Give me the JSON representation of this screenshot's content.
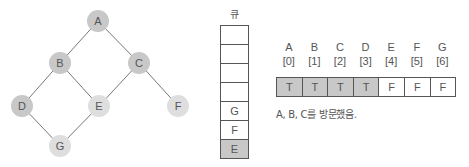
{
  "graph": {
    "nodes": [
      {
        "id": "A",
        "x": 98,
        "y": 21,
        "visited": true
      },
      {
        "id": "B",
        "x": 60,
        "y": 63,
        "visited": true
      },
      {
        "id": "C",
        "x": 139,
        "y": 63,
        "visited": true
      },
      {
        "id": "D",
        "x": 22,
        "y": 106,
        "visited": true
      },
      {
        "id": "E",
        "x": 99,
        "y": 106,
        "visited": false
      },
      {
        "id": "F",
        "x": 178,
        "y": 106,
        "visited": false
      },
      {
        "id": "G",
        "x": 60,
        "y": 146,
        "visited": false
      }
    ],
    "edges": [
      [
        "A",
        "B"
      ],
      [
        "A",
        "C"
      ],
      [
        "B",
        "D"
      ],
      [
        "B",
        "E"
      ],
      [
        "C",
        "E"
      ],
      [
        "C",
        "F"
      ],
      [
        "D",
        "G"
      ],
      [
        "E",
        "G"
      ]
    ],
    "colors": {
      "visited": "#c8c8c8",
      "unvisited": "#dedede",
      "edge": "#777777",
      "label": "#555555"
    }
  },
  "queue": {
    "title": "큐",
    "cells": [
      "",
      "",
      "",
      "",
      "G",
      "F",
      "E"
    ],
    "front_index": 6
  },
  "visited_array": {
    "labels": [
      {
        "node": "A",
        "index": "[0]"
      },
      {
        "node": "B",
        "index": "[1]"
      },
      {
        "node": "C",
        "index": "[2]"
      },
      {
        "node": "D",
        "index": "[3]"
      },
      {
        "node": "E",
        "index": "[4]"
      },
      {
        "node": "F",
        "index": "[5]"
      },
      {
        "node": "G",
        "index": "[6]"
      }
    ],
    "values": [
      "T",
      "T",
      "T",
      "T",
      "F",
      "F",
      "F"
    ],
    "colors": {
      "true": "#c8c8c8",
      "false": "#ffffff"
    }
  },
  "caption": "A, B, C를 방문했음."
}
